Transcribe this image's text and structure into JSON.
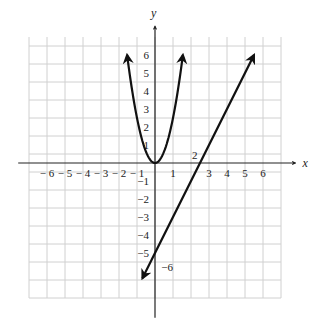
{
  "chart_data": {
    "type": "line",
    "title": "",
    "xlabel": "x",
    "ylabel": "y",
    "xlim": [
      -7,
      7
    ],
    "ylim": [
      -7.5,
      7
    ],
    "grid": true,
    "x_ticks": [
      -6,
      -5,
      -4,
      -3,
      -2,
      -1,
      1,
      3,
      4,
      5,
      6
    ],
    "x_tick_labels": [
      "− 6",
      "− 5",
      "− 4",
      "− 3",
      "− 2",
      "− 1",
      "1",
      "3",
      "4",
      "5",
      "6"
    ],
    "y_ticks": [
      6,
      5,
      4,
      3,
      2,
      1,
      -1,
      -2,
      -3,
      -4,
      -5
    ],
    "y_tick_labels": [
      "6",
      "5",
      "4",
      "3",
      "2",
      "1",
      "−1",
      "−2",
      "−3",
      "−4",
      "−5"
    ],
    "annotations": [
      {
        "text": "2",
        "x": 2.05,
        "y": 0.25
      },
      {
        "text": "−6",
        "x": 0.35,
        "y": -6
      }
    ],
    "series": [
      {
        "name": "parabola",
        "equation": "y = 2.5x^2",
        "x": [
          -1.55,
          -1.2,
          -0.8,
          -0.4,
          0,
          0.4,
          0.8,
          1.2,
          1.55
        ],
        "y": [
          6.0,
          3.6,
          1.6,
          0.4,
          0,
          0.4,
          1.6,
          3.6,
          6.0
        ],
        "arrows": "both"
      },
      {
        "name": "line",
        "equation": "y = 2x - 5",
        "x": [
          -0.7,
          5.5
        ],
        "y": [
          -6.4,
          6.0
        ],
        "arrows": "both"
      }
    ]
  },
  "colors": {
    "curve": "#111111",
    "grid": "#d0d0d0",
    "axis": "#222222"
  }
}
